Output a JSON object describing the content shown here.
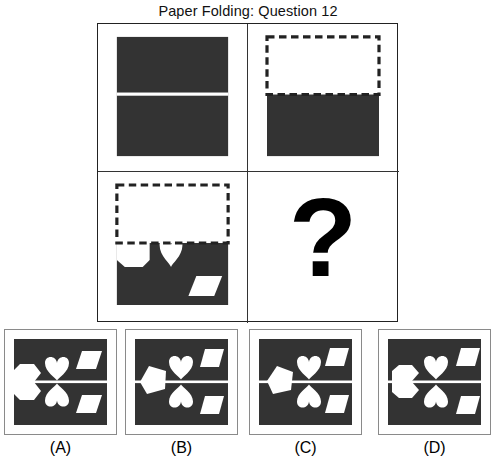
{
  "title": "Paper Folding: Question 12",
  "puzzle": {
    "type": "paper-folding",
    "question_number": 12,
    "paper_color": "#333333",
    "hole_color": "#ffffff",
    "fold_line_color": "#ffffff",
    "dashed_outline_color": "#222222",
    "question_mark": "?",
    "sequence": [
      {
        "step": 1,
        "name": "unfolded-sheet",
        "description": "Full dark square sheet with a horizontal crease line across the middle",
        "fold_line": "horizontal-center",
        "holes": []
      },
      {
        "step": 2,
        "name": "folded-sheet",
        "description": "Top half folded down behind; top half shown as dashed outline, bottom half solid dark",
        "fold_direction": "top-half-folded-down",
        "holes": []
      },
      {
        "step": 3,
        "name": "punched-sheet",
        "description": "Folded sheet with three punches: half-hexagon notch on the left fold edge, a heart below the fold edge, and a parallelogram at lower right",
        "holes": [
          {
            "shape": "half-hexagon",
            "position": "left-edge-on-fold",
            "label": "hexagon"
          },
          {
            "shape": "heart",
            "position": "center-below-fold",
            "label": "heart"
          },
          {
            "shape": "parallelogram",
            "position": "lower-right",
            "label": "parallelogram"
          }
        ]
      },
      {
        "step": 4,
        "name": "unknown-result",
        "description": "Unknown unfolded result indicated by a large question mark"
      }
    ]
  },
  "answers": [
    {
      "id": "A",
      "label": "(A)",
      "description": "Hexagon on left edge centered on crease; two hearts mirrored about the crease with points facing the crease; two parallelograms on the right",
      "left_shape": "hexagon",
      "heart_count": 2,
      "parallelogram_count": 2
    },
    {
      "id": "B",
      "label": "(B)",
      "description": "Pentagon on left edge; two hearts mirrored about the crease; two parallelograms on the right",
      "left_shape": "pentagon",
      "heart_count": 2,
      "parallelogram_count": 2
    },
    {
      "id": "C",
      "label": "(C)",
      "description": "Pentagon on left edge; two hearts mirrored about the crease shifted right; two parallelograms on the right",
      "left_shape": "pentagon",
      "heart_count": 2,
      "parallelogram_count": 2
    },
    {
      "id": "D",
      "label": "(D)",
      "description": "Hexagon on left edge centered on crease; two hearts mirrored about the crease; two parallelograms on the right edge",
      "left_shape": "hexagon",
      "heart_count": 2,
      "parallelogram_count": 2
    }
  ]
}
